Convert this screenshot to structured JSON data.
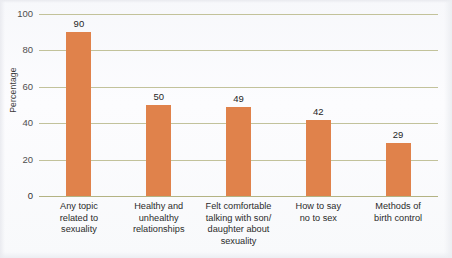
{
  "chart_data": {
    "type": "bar",
    "title": "",
    "xlabel": "",
    "ylabel": "Percentage",
    "ylim": [
      0,
      100
    ],
    "yticks": [
      0,
      20,
      40,
      60,
      80,
      100
    ],
    "grid": true,
    "legend": false,
    "categories": [
      "Any topic related to sexuality",
      "Healthy and unhealthy relationships",
      "Felt comfortable talking with son/ daughter about sexuality",
      "How to say no to sex",
      "Methods of birth control"
    ],
    "category_lines": [
      [
        "Any topic",
        "related to",
        "sexuality"
      ],
      [
        "Healthy and",
        "unhealthy",
        "relationships"
      ],
      [
        "Felt comfortable",
        "talking with son/",
        "daughter about",
        "sexuality"
      ],
      [
        "How to say",
        "no to sex"
      ],
      [
        "Methods of",
        "birth control"
      ]
    ],
    "values": [
      90,
      50,
      49,
      42,
      29
    ],
    "value_labels": [
      "90",
      "50",
      "49",
      "42",
      "29"
    ],
    "tick_labels": [
      "0",
      "20",
      "40",
      "60",
      "80",
      "100"
    ],
    "colors": {
      "bar": "#e0824b",
      "gridline": "#b9b98a",
      "axis": "#b3b383",
      "text": "#2b2b2b",
      "background": "#f9fafc"
    }
  }
}
